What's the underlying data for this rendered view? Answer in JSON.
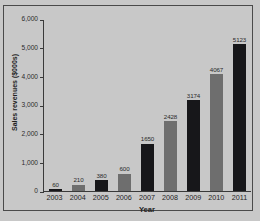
{
  "chart_data": {
    "type": "bar",
    "title": "",
    "subtitle": "",
    "xlabel": "Year",
    "ylabel": "Sales revenues ($000s)",
    "categories": [
      "2003",
      "2004",
      "2005",
      "2006",
      "2007",
      "2008",
      "2009",
      "2010",
      "2011"
    ],
    "values": [
      60,
      210,
      380,
      600,
      1650,
      2428,
      3174,
      4067,
      5123
    ],
    "value_labels": [
      "60",
      "210",
      "380",
      "600",
      "1650",
      "2428",
      "3174",
      "4067",
      "5123"
    ],
    "bar_colors": [
      "#17171a",
      "#6e6e6e",
      "#17171a",
      "#6e6e6e",
      "#17171a",
      "#6e6e6e",
      "#17171a",
      "#6e6e6e",
      "#17171a"
    ],
    "ylim": [
      0,
      6000
    ],
    "yticks": [
      0,
      1000,
      2000,
      3000,
      4000,
      5000,
      6000
    ],
    "ytick_labels": [
      "0",
      "1,000",
      "2,000",
      "3,000",
      "4,000",
      "5,000",
      "6,000"
    ],
    "grid": false,
    "legend": false,
    "legend_position": "none",
    "background_color": "#c8c8c8",
    "axis_color": "#3a3a3a",
    "frame_color": "#4a4a4a"
  }
}
